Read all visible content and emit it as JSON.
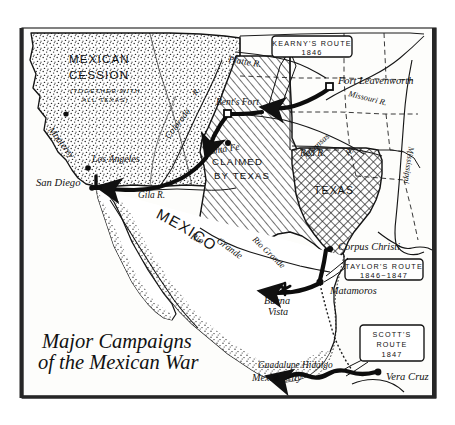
{
  "map": {
    "title_line1": "Major Campaigns",
    "title_line2": "of the Mexican War",
    "frame_color": "#1a1a1a",
    "background_color": "#fdfdfb",
    "ink_color": "#111111"
  },
  "regions": [
    {
      "id": "mexican-cession",
      "name_line1": "MEXICAN",
      "name_line2": "CESSION",
      "sub_line1": "(TOGETHER WITH",
      "sub_line2": "ALL TEXAS)",
      "fill_pattern": "stipple"
    },
    {
      "id": "claimed-by-texas",
      "name_line1": "CLAIMED",
      "name_line2": "BY TEXAS",
      "fill_pattern": "diagonal-hatch"
    },
    {
      "id": "texas",
      "name_line1": "TEXAS",
      "fill_pattern": "cross-hatch"
    },
    {
      "id": "mexico",
      "name_line1": "MEXICO",
      "fill_pattern": "none"
    }
  ],
  "callouts": [
    {
      "id": "kearny",
      "line1": "KEARNY'S ROUTE",
      "line2": "1846"
    },
    {
      "id": "taylor",
      "line1": "TAYLOR'S ROUTE",
      "line2": "1846~1847"
    },
    {
      "id": "scott",
      "line1": "SCOTT'S",
      "line2": "ROUTE",
      "line3": "1847"
    }
  ],
  "places": [
    {
      "id": "monterey",
      "label": "Monterey",
      "marker": "dot"
    },
    {
      "id": "los-angeles",
      "label": "Los Angeles",
      "marker": "dot"
    },
    {
      "id": "san-diego",
      "label": "San Diego",
      "marker": "dot"
    },
    {
      "id": "santa-fe",
      "label": "Santa Fe",
      "marker": "dot"
    },
    {
      "id": "bents-fort",
      "label": "Bent's Fort",
      "marker": "square"
    },
    {
      "id": "fort-leavenworth",
      "label": "Fort Leavenworth",
      "marker": "square"
    },
    {
      "id": "corpus-christi",
      "label": "Corpus Christi",
      "marker": "dot"
    },
    {
      "id": "matamoros",
      "label": "Matamoros",
      "marker": "dot"
    },
    {
      "id": "buena-vista",
      "label": "Buena Vista",
      "marker": "star"
    },
    {
      "id": "mexico-city",
      "label": "Mexico City",
      "marker": "dot"
    },
    {
      "id": "guadalupe-hidalgo",
      "label": "Guadalupe Hidalgo",
      "marker": "none"
    },
    {
      "id": "vera-cruz",
      "label": "Vera Cruz",
      "marker": "dot"
    }
  ],
  "rivers": [
    {
      "id": "platte",
      "label": "Platte R."
    },
    {
      "id": "missouri",
      "label": "Missouri R."
    },
    {
      "id": "arkansas",
      "label": "Arkansas"
    },
    {
      "id": "arkansas-r",
      "label": "R."
    },
    {
      "id": "red",
      "label": "Red R."
    },
    {
      "id": "colorado",
      "label": "Colorado"
    },
    {
      "id": "colorado-r",
      "label": "R."
    },
    {
      "id": "gila",
      "label": "Gila R."
    },
    {
      "id": "rio",
      "label": "Rio"
    },
    {
      "id": "grande",
      "label": "Grande"
    },
    {
      "id": "rio-grande-bend",
      "label": "Rio Grande"
    },
    {
      "id": "mississippi",
      "label": "Mississippi"
    }
  ]
}
